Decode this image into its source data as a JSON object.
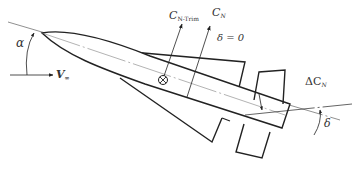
{
  "diagram": {
    "labels": {
      "alpha": "α",
      "v_main": "V",
      "v_sub": "∞",
      "cn_trim_main": "C",
      "cn_trim_sub": "N-Trim",
      "cn_main": "C",
      "cn_sub": "N",
      "delta_zero": "δ = 0",
      "delta_cn_prefix": "ΔC",
      "delta_cn_sub": "N",
      "delta": "δ"
    },
    "symbols": {
      "center_of_gravity": "⊗"
    },
    "colors": {
      "stroke": "#222222",
      "text": "#333333",
      "background": "#ffffff"
    }
  }
}
